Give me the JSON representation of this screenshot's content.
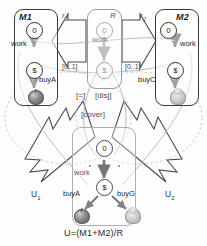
{
  "diagram": {
    "title_equation": "U=(M1+M2)/R",
    "components": {
      "m1": {
        "name": "M1",
        "states": {
          "initial": "0",
          "money": "$"
        },
        "transitions": {
          "work": "work",
          "buy": "buyA"
        },
        "product_icon": "apple-icon"
      },
      "m2": {
        "name": "M2",
        "states": {
          "initial": "0",
          "money": "$"
        },
        "transitions": {
          "work": "work",
          "buy": "buyC"
        },
        "product_icon": "plant-icon"
      },
      "r": {
        "name": "R",
        "states": {
          "initial": "0",
          "money": "$"
        },
        "transitions": {
          "work": "work"
        }
      },
      "u": {
        "states": {
          "initial": "0",
          "money": "$"
        },
        "transitions": {
          "work": "work",
          "buy_left": "buyA",
          "buy_right": "buyG"
        },
        "product_icon_left": "apple-icon",
        "product_icon_right": "plant-icon"
      }
    },
    "relations": {
      "r1": "r",
      "r1_sub": "1",
      "r2": "r",
      "r2_sub": "2",
      "mult_left": "[0..1]",
      "mult_right": "[0..1]",
      "u1": "U",
      "u1_sub": "1",
      "u2": "U",
      "u2_sub": "2"
    },
    "keywords": {
      "equal": "[=]",
      "disj": "[disj]",
      "cover": "[cover]"
    },
    "colors": {
      "stroke_dark": "#2f2f2f",
      "stroke_soft": "#a6a6a6",
      "background": "#fdfdfd",
      "text": "#1f1f1f"
    }
  }
}
